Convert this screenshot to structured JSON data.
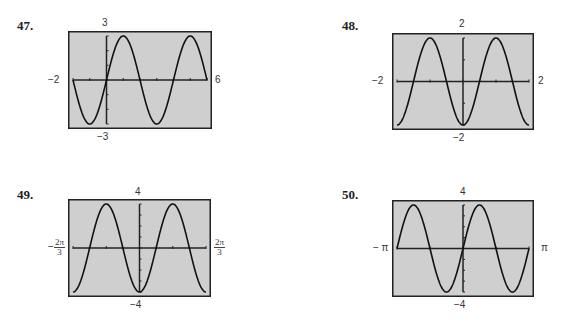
{
  "problems": [
    {
      "number": "47.",
      "xmin_label": "−2",
      "xmax_label": "6",
      "ymax_label": "3",
      "ymin_label": "−3"
    },
    {
      "number": "48.",
      "xmin_label": "−2",
      "xmax_label": "2",
      "ymax_label": "2",
      "ymin_label": "−2"
    },
    {
      "number": "49.",
      "xmin_label": {
        "sign": "−",
        "num": "2π",
        "den": "3"
      },
      "xmax_label": {
        "num": "2π",
        "den": "3"
      },
      "ymax_label": "4",
      "ymin_label": "−4"
    },
    {
      "number": "50.",
      "xmin_label": "− π",
      "xmax_label": "π",
      "ymax_label": "4",
      "ymin_label": "−4"
    }
  ],
  "chart_data": [
    {
      "type": "line",
      "title": "47.",
      "xlim": [
        -2,
        6
      ],
      "ylim": [
        -3,
        3
      ],
      "x_tick_step": 1,
      "y_tick_step": 1,
      "function": "y = 3 sin(πx/2)",
      "x": [
        -2,
        -1,
        0,
        1,
        2,
        3,
        4,
        5,
        6
      ],
      "y": [
        0,
        -3,
        0,
        3,
        0,
        -3,
        0,
        3,
        0
      ],
      "grid": false,
      "background": "#cfcfcf"
    },
    {
      "type": "line",
      "title": "48.",
      "xlim": [
        -2,
        2
      ],
      "ylim": [
        -2,
        2
      ],
      "x_tick_step": 1,
      "y_tick_step": 1,
      "function": "y = -2 cos(πx)",
      "x": [
        -2,
        -1.5,
        -1,
        -0.5,
        0,
        0.5,
        1,
        1.5,
        2
      ],
      "y": [
        -2,
        0,
        2,
        0,
        -2,
        0,
        2,
        0,
        -2
      ],
      "grid": false,
      "background": "#cfcfcf"
    },
    {
      "type": "line",
      "title": "49.",
      "xlim": [
        "-2π/3",
        "2π/3"
      ],
      "ylim": [
        -4,
        4
      ],
      "x_tick_step": "π/3",
      "y_tick_step": 1,
      "function": "y = -4 cos(3x)",
      "x": [
        "-2π/3",
        "-π/2",
        "-π/3",
        "-π/6",
        "0",
        "π/6",
        "π/3",
        "π/2",
        "2π/3"
      ],
      "y": [
        -4,
        0,
        4,
        0,
        -4,
        0,
        4,
        0,
        -4
      ],
      "grid": false,
      "background": "#cfcfcf"
    },
    {
      "type": "line",
      "title": "50.",
      "xlim": [
        "-π",
        "π"
      ],
      "ylim": [
        -4,
        4
      ],
      "x_tick_step": "π/2",
      "y_tick_step": 1,
      "function": "y = 4 sin(2x)",
      "x": [
        "-π",
        "-3π/4",
        "-π/2",
        "-π/4",
        "0",
        "π/4",
        "π/2",
        "3π/4",
        "π"
      ],
      "y": [
        0,
        4,
        0,
        -4,
        0,
        4,
        0,
        -4,
        0
      ],
      "grid": false,
      "background": "#cfcfcf"
    }
  ]
}
